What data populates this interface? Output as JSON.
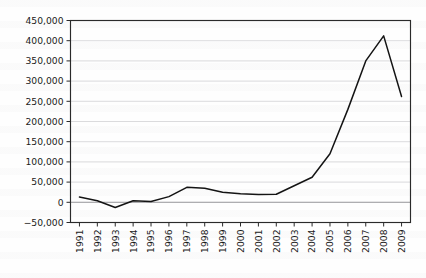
{
  "chart_data": {
    "type": "line",
    "title": "",
    "subtitle": "",
    "xlabel": "",
    "ylabel": "",
    "grid": true,
    "legend": false,
    "legend_position": "none",
    "line_color": "#141414",
    "grid_color": "#d2d2d4",
    "axis_color": "#2a2a2a",
    "background_color": "#fefefe",
    "categories": [
      "1991",
      "1992",
      "1993",
      "1994",
      "1995",
      "1996",
      "1997",
      "1998",
      "1999",
      "2000",
      "2001",
      "2002",
      "2003",
      "2004",
      "2005",
      "2006",
      "2007",
      "2008",
      "2009"
    ],
    "values": [
      13000,
      4000,
      -13000,
      4000,
      2000,
      14000,
      37000,
      35000,
      25000,
      21000,
      19000,
      20000,
      41000,
      62000,
      120000,
      230000,
      350000,
      412000,
      262000
    ],
    "ylim": [
      -50000,
      450000
    ],
    "ytick_values": [
      -50000,
      0,
      50000,
      100000,
      150000,
      200000,
      250000,
      300000,
      350000,
      400000,
      450000
    ],
    "ytick_labels": [
      "-50,000",
      "0",
      "50,000",
      "100,000",
      "150,000",
      "200,000",
      "250,000",
      "300,000",
      "350,000",
      "400,000",
      "450,000"
    ],
    "xtick_labels": [
      "1991",
      "1992",
      "1993",
      "1994",
      "1995",
      "1996",
      "1997",
      "1998",
      "1999",
      "2000",
      "2001",
      "2002",
      "2003",
      "2004",
      "2005",
      "2006",
      "2007",
      "2008",
      "2009"
    ],
    "xtick_rotation": -90,
    "annotations": []
  }
}
